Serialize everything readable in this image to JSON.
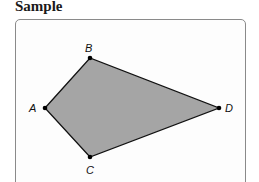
{
  "title": "Sample",
  "figure": {
    "shape": "quadrilateral",
    "fill": "#a5a5a5",
    "stroke": "#111111",
    "vertices": [
      {
        "label": "A",
        "x": 45,
        "y": 108
      },
      {
        "label": "B",
        "x": 90,
        "y": 58
      },
      {
        "label": "D",
        "x": 219,
        "y": 108
      },
      {
        "label": "C",
        "x": 90,
        "y": 157
      }
    ]
  },
  "labels": {
    "A": "A",
    "B": "B",
    "C": "C",
    "D": "D"
  }
}
